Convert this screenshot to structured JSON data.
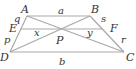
{
  "diagram": {
    "type": "trapezoid",
    "line_color": "#a9a9a9",
    "label_color": "#333333",
    "points": {
      "A": {
        "x": 27,
        "y": 16
      },
      "B": {
        "x": 90,
        "y": 16
      },
      "C": {
        "x": 124,
        "y": 52
      },
      "D": {
        "x": 10,
        "y": 52
      },
      "E": {
        "x": 20,
        "y": 29
      },
      "F": {
        "x": 103,
        "y": 29
      },
      "P": {
        "x": 63,
        "y": 29
      }
    },
    "labels": {
      "A": "A",
      "B": "B",
      "C": "C",
      "D": "D",
      "E": "E",
      "F": "F",
      "P": "P",
      "a": "a",
      "b": "b",
      "x": "x",
      "y": "y",
      "p": "p",
      "q": "q",
      "r": "r",
      "s": "s"
    },
    "segments": [
      {
        "from": "A",
        "to": "B",
        "label": "a"
      },
      {
        "from": "D",
        "to": "C",
        "label": "b"
      },
      {
        "from": "A",
        "to": "D"
      },
      {
        "from": "B",
        "to": "C"
      },
      {
        "from": "A",
        "to": "C"
      },
      {
        "from": "B",
        "to": "D"
      },
      {
        "from": "E",
        "to": "F"
      }
    ],
    "segment_labels": {
      "AE": "q",
      "ED": "p",
      "BF": "s",
      "FC": "r",
      "EP": "x",
      "PF": "y"
    }
  }
}
